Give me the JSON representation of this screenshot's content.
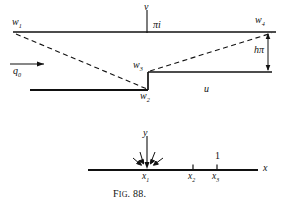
{
  "figure": {
    "caption_prefix": "F",
    "caption_small": "IG",
    "caption_number": ". 88.",
    "caption_full": "FIG. 88."
  },
  "upper_diagram": {
    "name": "w-plane-flow-region",
    "axis_labels": {
      "vertical": "v",
      "horizontal": "u"
    },
    "points": [
      {
        "id": "w1",
        "base": "w",
        "sub": "1"
      },
      {
        "id": "w2",
        "base": "w",
        "sub": "2"
      },
      {
        "id": "w3",
        "base": "w",
        "sub": "3"
      },
      {
        "id": "w4",
        "base": "w",
        "sub": "4"
      }
    ],
    "annotations": {
      "pi_i": "πi",
      "h_pi": "hπ",
      "flux": "q",
      "flux_sub": "0"
    }
  },
  "lower_diagram": {
    "name": "x-axis-plane",
    "axis_labels": {
      "vertical": "y",
      "horizontal": "x"
    },
    "ticks": [
      {
        "id": "x1",
        "base": "x",
        "sub": "1",
        "above": ""
      },
      {
        "id": "x2",
        "base": "x",
        "sub": "2",
        "above": ""
      },
      {
        "id": "x3",
        "base": "x",
        "sub": "3",
        "above": "1"
      }
    ]
  },
  "colors": {
    "ink": "#111111",
    "paper": "#ffffff"
  }
}
